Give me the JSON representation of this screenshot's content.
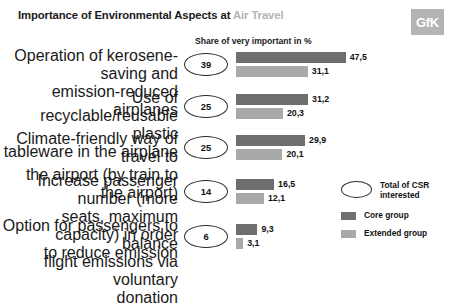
{
  "header": {
    "title_main": "Importance of Environmental Aspects at ",
    "title_subject": "Air Travel",
    "logo": "GfK",
    "axis_caption": "Share of very important in %"
  },
  "legend": {
    "bubble_label_line1": "Total of CSR",
    "bubble_label_line2": "interested",
    "core_label": "Core group",
    "extended_label": "Extended group",
    "core_color": "#6e6e6e",
    "extended_color": "#a9a9a9"
  },
  "chart_data": {
    "type": "bar",
    "title": "Importance of Environmental Aspects at Air Travel",
    "subtitle": "Share of very important in %",
    "xlabel": "",
    "ylabel": "",
    "orientation": "horizontal",
    "grid": false,
    "legend_position": "bottom-right",
    "xlim": [
      0,
      50
    ],
    "categories": [
      "Operation of kerosene-saving and emission-reduced airplanes",
      "Use of recyclable/reusable plastic tableware in the airplane",
      "Climate-friendly way of travel to the airport (by train to the airport)",
      "Increase passenger number (more seats, maximum capacity) in order to reduce emission",
      "Option for passengers to balance flight emissions via voluntary donation"
    ],
    "series": [
      {
        "name": "Core group",
        "color": "#6e6e6e",
        "values": [
          47.5,
          31.2,
          29.9,
          16.5,
          9.3
        ],
        "labels": [
          "47,5",
          "31,2",
          "29,9",
          "16,5",
          "9,3"
        ]
      },
      {
        "name": "Extended group",
        "color": "#a9a9a9",
        "values": [
          31.1,
          20.3,
          20.1,
          12.1,
          3.1
        ],
        "labels": [
          "31,1",
          "20,3",
          "20,1",
          "12,1",
          "3,1"
        ]
      },
      {
        "name": "Total of CSR interested",
        "color": "#ffffff",
        "values": [
          39,
          25,
          25,
          14,
          6
        ],
        "labels": [
          "39",
          "25",
          "25",
          "14",
          "6"
        ]
      }
    ]
  },
  "rows": [
    {
      "label_lines": [
        "Operation of kerosene-saving and",
        "emission-reduced airplanes"
      ],
      "bubble": "39",
      "core_label": "47,5",
      "extended_label": "31,1"
    },
    {
      "label_lines": [
        "Use of recyclable/reusable plastic",
        "tableware in the airplane"
      ],
      "bubble": "25",
      "core_label": "31,2",
      "extended_label": "20,3"
    },
    {
      "label_lines": [
        "Climate-friendly way of travel to",
        "the airport (by train to the airport)"
      ],
      "bubble": "25",
      "core_label": "29,9",
      "extended_label": "20,1"
    },
    {
      "label_lines": [
        "Increase passenger number (more",
        "seats, maximum capacity) in order",
        "to reduce emission"
      ],
      "bubble": "14",
      "core_label": "16,5",
      "extended_label": "12,1"
    },
    {
      "label_lines": [
        "Option for passengers to balance",
        "flight emissions via voluntary",
        "donation"
      ],
      "bubble": "6",
      "core_label": "9,3",
      "extended_label": "3,1"
    }
  ]
}
